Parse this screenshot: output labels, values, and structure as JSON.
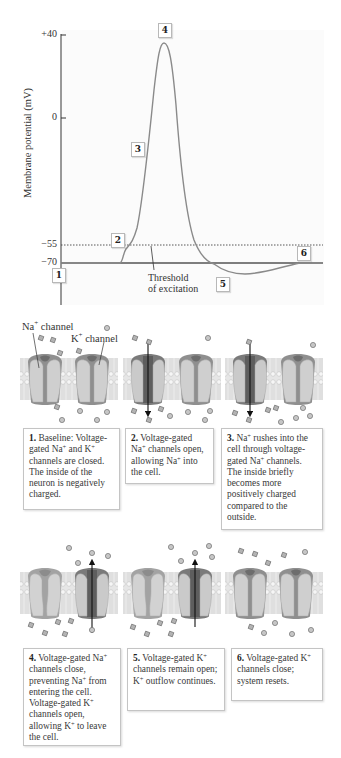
{
  "chart_data": {
    "type": "line",
    "title": "",
    "ylabel": "Membrane potential (mV)",
    "xlabel": "",
    "yticks": [
      "+40",
      "0",
      "-55",
      "-70"
    ],
    "ylim": [
      -85,
      40
    ],
    "resting_potential": -70,
    "threshold": -55,
    "threshold_label": [
      "Threshold",
      "of excitation"
    ],
    "series": [
      {
        "name": "Action potential",
        "points": [
          {
            "t": 0,
            "v": -70
          },
          {
            "t": 60,
            "v": -70
          },
          {
            "t": 64,
            "v": -62
          },
          {
            "t": 68,
            "v": -55
          },
          {
            "t": 80,
            "v": -20
          },
          {
            "t": 90,
            "v": 20
          },
          {
            "t": 103,
            "v": 37
          },
          {
            "t": 116,
            "v": 10
          },
          {
            "t": 128,
            "v": -40
          },
          {
            "t": 140,
            "v": -60
          },
          {
            "t": 152,
            "v": -70
          },
          {
            "t": 178,
            "v": -77
          },
          {
            "t": 210,
            "v": -74
          },
          {
            "t": 240,
            "v": -70
          },
          {
            "t": 262,
            "v": -70
          }
        ]
      }
    ],
    "stage_markers": [
      {
        "id": "1",
        "v": -70,
        "phase": "resting"
      },
      {
        "id": "2",
        "v": -55,
        "phase": "threshold"
      },
      {
        "id": "3",
        "v": -20,
        "phase": "depolarization"
      },
      {
        "id": "4",
        "v": 37,
        "phase": "peak"
      },
      {
        "id": "5",
        "v": -77,
        "phase": "hyperpolarization"
      },
      {
        "id": "6",
        "v": -70,
        "phase": "return to rest"
      }
    ],
    "grid": false,
    "legend": "none"
  },
  "chart": {
    "ylabel": "Membrane potential (mV)",
    "ticks": {
      "p40": "+40",
      "zero": "0",
      "m55": "−55",
      "m70": "−70"
    },
    "markers": {
      "m1": "1",
      "m2": "2",
      "m3": "3",
      "m4": "4",
      "m5": "5",
      "m6": "6"
    },
    "threshold_line1": "Threshold",
    "threshold_line2": "of excitation"
  },
  "labels": {
    "na_channel": "Na",
    "na_sup": "+",
    "na_suffix": " channel",
    "k_channel": "K",
    "k_sup": "+",
    "k_suffix": " channel"
  },
  "colors": {
    "curve": "#8a8a8a",
    "membrane": "#dcdcdc",
    "channel": "#c8c8c8",
    "pore_open": "#6f6f6f",
    "ion": "#a9a9a9",
    "arrow": "#111111"
  },
  "steps": [
    {
      "num": "1.",
      "text_html": "Baseline: Voltage-gated Na<sup>+</sup> and K<sup>+</sup> channels are closed. The inside of the neuron is negatively charged."
    },
    {
      "num": "2.",
      "text_html": "Voltage-gated Na<sup>+</sup> channels open, allowing Na<sup>+</sup> into the cell."
    },
    {
      "num": "3.",
      "text_html": "Na<sup>+</sup> rushes into the cell through voltage-gated Na<sup>+</sup> channels. The inside briefly becomes more positively charged compared to the outside."
    },
    {
      "num": "4.",
      "text_html": "Voltage-gated Na<sup>+</sup> channels close, preventing Na<sup>+</sup> from entering the cell. Voltage-gated K<sup>+</sup> channels open, allowing K<sup>+</sup> to leave the cell."
    },
    {
      "num": "5.",
      "text_html": "Voltage-gated K<sup>+</sup> channels remain open; K<sup>+</sup> outflow continues."
    },
    {
      "num": "6.",
      "text_html": "Voltage-gated K<sup>+</sup> channels close; system resets."
    }
  ]
}
